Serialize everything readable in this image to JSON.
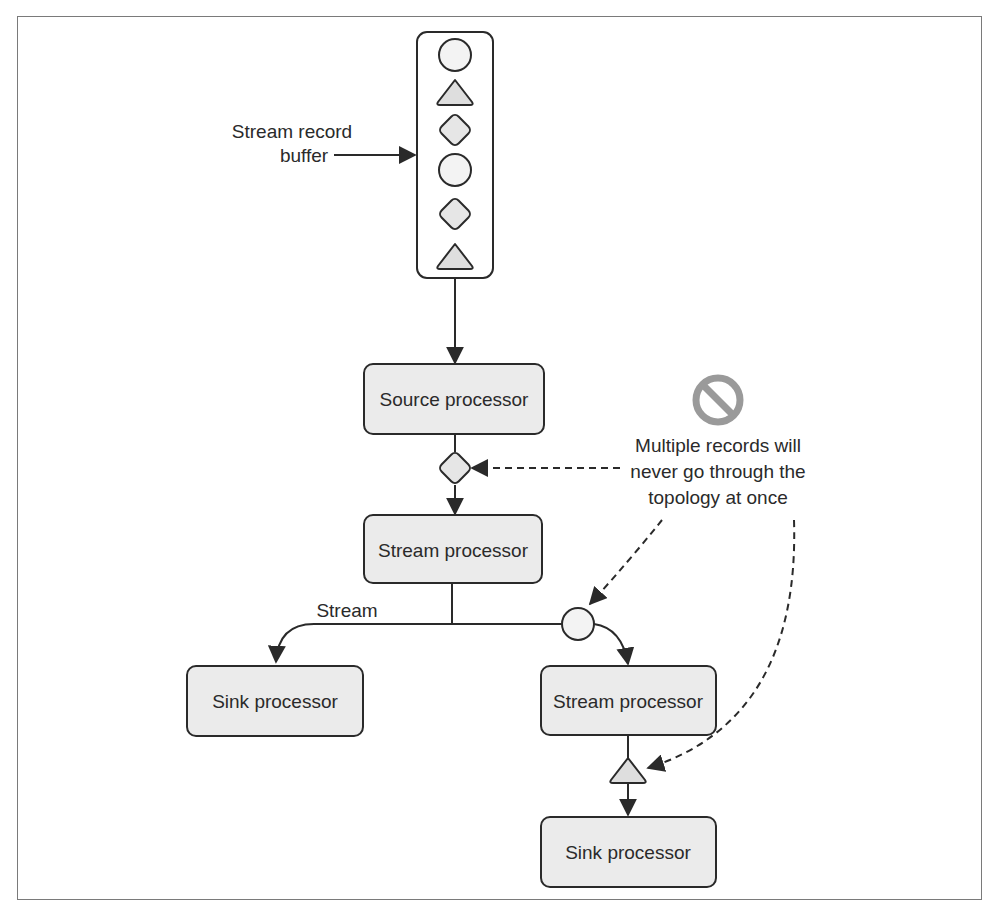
{
  "diagram": {
    "buffer": {
      "label_line1": "Stream record",
      "label_line2": "buffer",
      "records": [
        "circle",
        "triangle",
        "diamond",
        "circle",
        "diamond",
        "triangle"
      ]
    },
    "nodes": {
      "source": "Source processor",
      "stream1": "Stream processor",
      "sink_left": "Sink processor",
      "stream2": "Stream processor",
      "sink_right": "Sink processor"
    },
    "edge_label_stream": "Stream",
    "annotation": {
      "icon": "prohibited-icon",
      "line1": "Multiple records will",
      "line2": "never go through the",
      "line3": "topology at once"
    },
    "colors": {
      "stroke": "#2a2a2a",
      "box_fill": "#ebebeb",
      "circle_fill": "#f3f3f3",
      "shape_fill": "#dedede",
      "prohibited": "#9a9a9a",
      "frame": "#7a7a7a"
    }
  }
}
